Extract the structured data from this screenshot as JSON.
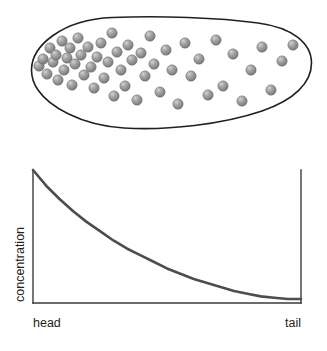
{
  "figure": {
    "background_color": "#ffffff"
  },
  "organism_panel": {
    "name": "embryo-outline-with-particles",
    "outline": {
      "stroke_color": "#231f20",
      "stroke_width": 1.6,
      "fill_color": "#ffffff",
      "shape": "elongated-oval",
      "bounds": {
        "x": 31,
        "y": 16,
        "width": 281,
        "height": 114
      }
    },
    "particle": {
      "label": "morphogen-molecule",
      "fill_color": "#8b8b8b",
      "highlight_color": "#c8c8c8",
      "edge_color": "#6e6e6e",
      "radius": 5.2,
      "count": 45
    },
    "particle_positions": [
      [
        39,
        66
      ],
      [
        43,
        59
      ],
      [
        47,
        74
      ],
      [
        50,
        48
      ],
      [
        53,
        62
      ],
      [
        56,
        55
      ],
      [
        58,
        80
      ],
      [
        62,
        41
      ],
      [
        64,
        70
      ],
      [
        67,
        58
      ],
      [
        70,
        48
      ],
      [
        72,
        85
      ],
      [
        75,
        64
      ],
      [
        78,
        38
      ],
      [
        81,
        55
      ],
      [
        84,
        75
      ],
      [
        88,
        47
      ],
      [
        91,
        67
      ],
      [
        94,
        88
      ],
      [
        97,
        57
      ],
      [
        101,
        43
      ],
      [
        104,
        78
      ],
      [
        108,
        62
      ],
      [
        112,
        33
      ],
      [
        114,
        96
      ],
      [
        117,
        52
      ],
      [
        121,
        70
      ],
      [
        125,
        86
      ],
      [
        128,
        45
      ],
      [
        132,
        60
      ],
      [
        137,
        100
      ],
      [
        141,
        53
      ],
      [
        145,
        76
      ],
      [
        150,
        36
      ],
      [
        154,
        64
      ],
      [
        160,
        92
      ],
      [
        166,
        50
      ],
      [
        172,
        70
      ],
      [
        178,
        104
      ],
      [
        185,
        43
      ],
      [
        191,
        76
      ],
      [
        199,
        59
      ],
      [
        208,
        95
      ],
      [
        216,
        40
      ],
      [
        223,
        86
      ],
      [
        233,
        54
      ],
      [
        242,
        101
      ],
      [
        251,
        70
      ],
      [
        262,
        47
      ],
      [
        271,
        90
      ],
      [
        282,
        61
      ],
      [
        293,
        45
      ]
    ]
  },
  "chart_data": {
    "type": "line",
    "title": "",
    "subtitle": "",
    "xlabel": "",
    "ylabel": "concentration",
    "grid": false,
    "legend": null,
    "annotations": [],
    "x_tick_labels": [
      "head",
      "tail"
    ],
    "x_tick_positions": [
      0,
      1
    ],
    "y_tick_labels": [],
    "xlim": [
      0,
      1
    ],
    "ylim": [
      0,
      1
    ],
    "axis_color": "#3a3a3a",
    "axis_line_width": 1.4,
    "series": [
      {
        "name": "concentration",
        "color": "#4d4d4d",
        "line_width": 2.6,
        "x": [
          0.0,
          0.05,
          0.1,
          0.15,
          0.2,
          0.25,
          0.3,
          0.35,
          0.4,
          0.45,
          0.5,
          0.55,
          0.6,
          0.65,
          0.7,
          0.75,
          0.8,
          0.85,
          0.9,
          0.95,
          1.0
        ],
        "y": [
          1.0,
          0.88,
          0.78,
          0.69,
          0.61,
          0.54,
          0.47,
          0.41,
          0.36,
          0.31,
          0.26,
          0.22,
          0.18,
          0.15,
          0.12,
          0.09,
          0.07,
          0.05,
          0.04,
          0.03,
          0.03
        ]
      }
    ]
  },
  "axes_geometry": {
    "plot_left": 33,
    "plot_right": 301,
    "plot_top": 170,
    "plot_bottom": 303,
    "right_spine": true,
    "left_spine": true,
    "bottom_spine": true,
    "top_spine": false
  },
  "labels": {
    "y_axis_title": "concentration",
    "x_left_label": "head",
    "x_right_label": "tail"
  }
}
